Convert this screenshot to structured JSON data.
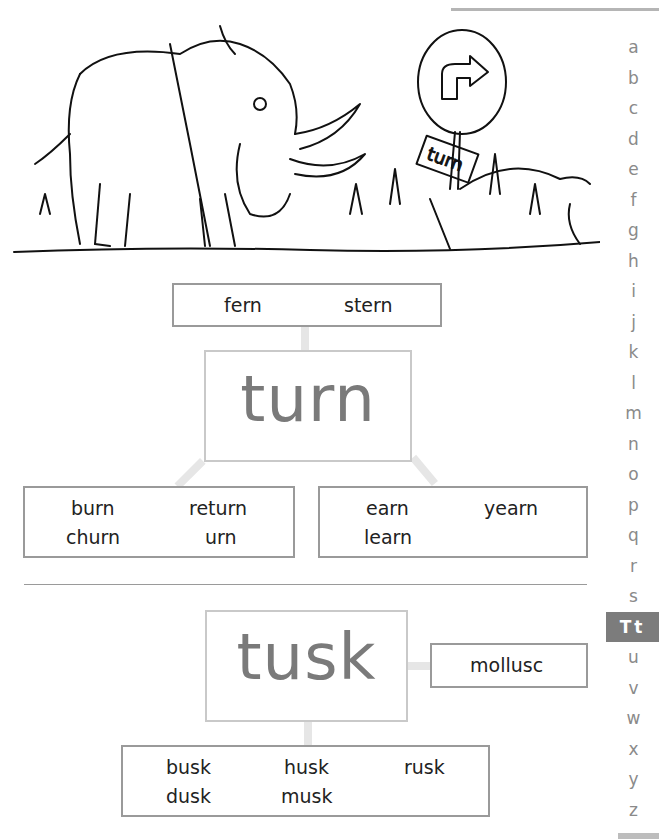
{
  "illustration": {
    "description": "Line drawing of a woolly mammoth standing in grass beside a round road sign with a right-turn arrow",
    "sign_text": "turn"
  },
  "alphabet_index": {
    "letters": [
      "a",
      "b",
      "c",
      "d",
      "e",
      "f",
      "g",
      "h",
      "i",
      "j",
      "k",
      "l",
      "m",
      "n",
      "o",
      "p",
      "q",
      "r",
      "s",
      "Tt",
      "u",
      "v",
      "w",
      "x",
      "y",
      "z"
    ],
    "active": "Tt",
    "active_bg_color": "#7c7c7c"
  },
  "turn_web": {
    "headword": "turn",
    "top_box": {
      "words": [
        "fern",
        "stern"
      ]
    },
    "left_box": {
      "words": [
        "burn",
        "return",
        "churn",
        "urn"
      ]
    },
    "right_box": {
      "words": [
        "earn",
        "yearn",
        "learn"
      ]
    }
  },
  "tusk_web": {
    "headword": "tusk",
    "side_box": {
      "words": [
        "mollusc"
      ]
    },
    "bottom_box": {
      "words": [
        "busk",
        "husk",
        "rusk",
        "dusk",
        "musk"
      ]
    }
  },
  "colors": {
    "headword": "#7a7a7a",
    "box_border": "#9a9a9a",
    "connector": "#e6e6e6",
    "index_letter": "#8a8a8a"
  }
}
